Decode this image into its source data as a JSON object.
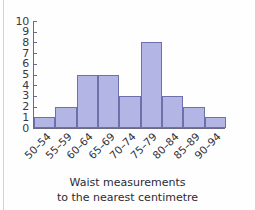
{
  "chart_data": {
    "type": "bar",
    "title": "",
    "subtitle": "",
    "xlabel": "Waist measurements to the nearest centimetre",
    "ylabel": "",
    "categories": [
      "50–54",
      "55–59",
      "60–64",
      "65–69",
      "70–74",
      "75–79",
      "80–84",
      "85–89",
      "90–94"
    ],
    "values": [
      1,
      2,
      5,
      5,
      3,
      8,
      3,
      2,
      1
    ],
    "ylim": [
      0,
      10
    ],
    "y_ticks": [
      0,
      1,
      2,
      3,
      4,
      5,
      6,
      7,
      8,
      9,
      10
    ],
    "y_tick_labels": [
      "0",
      "1",
      "2",
      "3",
      "4",
      "5",
      "6",
      "7",
      "8",
      "9",
      "10"
    ],
    "grid": false,
    "legend": null,
    "bar_gap": 0,
    "total_frequency": 30,
    "colors": {
      "bar_fill": "#b3b5e4",
      "bar_edge": "#6e70ad",
      "axis": "#6a6a86",
      "text": "#2f2f38",
      "background": "#fefeff"
    }
  },
  "caption": {
    "line1": "Waist measurements",
    "line2": "to the nearest centimetre"
  }
}
